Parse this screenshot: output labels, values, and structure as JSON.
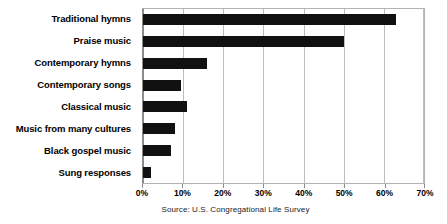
{
  "chart_data": {
    "type": "bar",
    "orientation": "horizontal",
    "title": "",
    "subtitle": "",
    "xlabel": "",
    "ylabel": "",
    "categories": [
      "Traditional hymns",
      "Praise music",
      "Contemporary hymns",
      "Contemporary songs",
      "Classical music",
      "Music from many cultures",
      "Black gospel music",
      "Sung responses"
    ],
    "values": [
      63,
      50,
      16,
      9.5,
      11,
      8,
      7,
      2
    ],
    "value_unit": "%",
    "xlim": [
      0,
      70
    ],
    "xticks": [
      0,
      10,
      20,
      30,
      40,
      50,
      60,
      70
    ],
    "xtick_labels": [
      "0%",
      "10%",
      "20%",
      "30%",
      "40%",
      "50%",
      "60%",
      "70%"
    ],
    "grid": "vertical",
    "legend": "none",
    "bar_color": "#111111",
    "gridline_color": "#bdbdbd",
    "plot_border_color": "#b3b3b3",
    "background_color": "#ffffff"
  },
  "source": {
    "text": "Source: U.S. Congregational Life Survey"
  }
}
